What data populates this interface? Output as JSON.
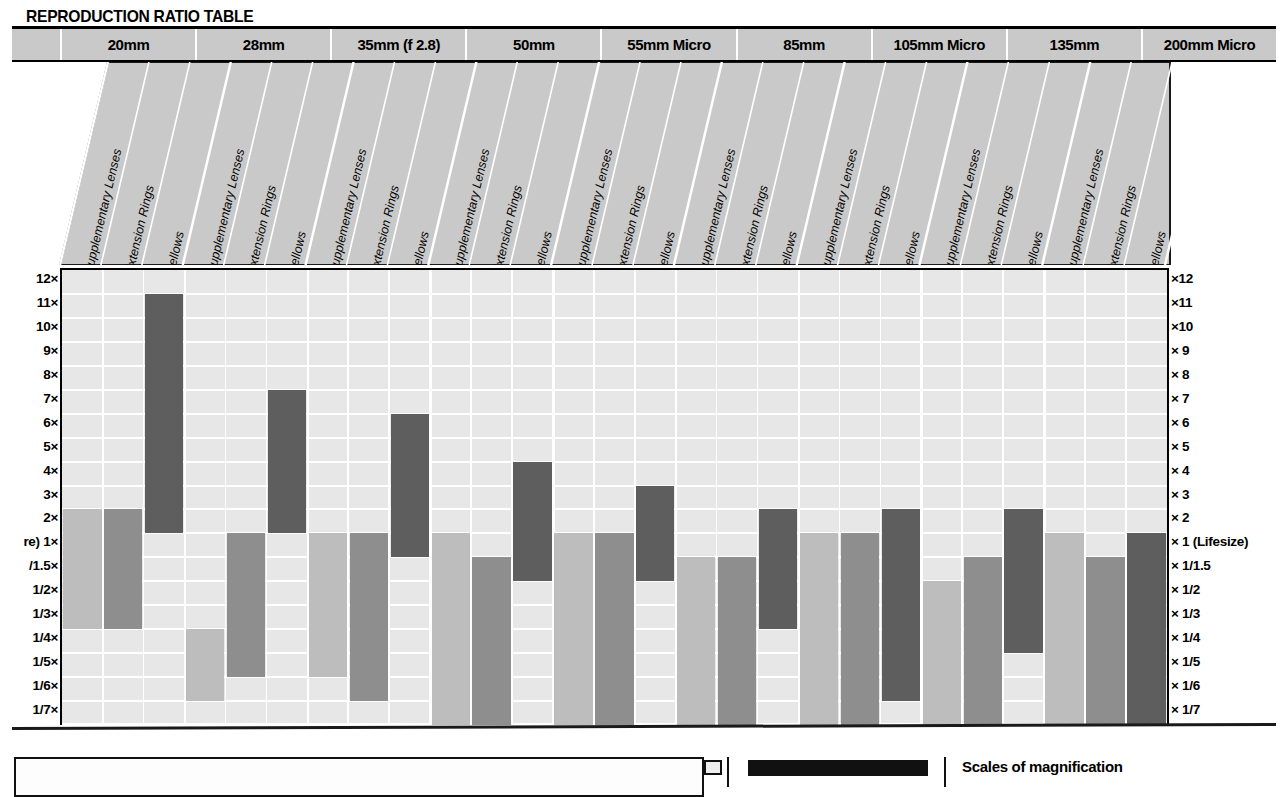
{
  "header": {
    "title": "REPRODUCTION RATIO TABLE"
  },
  "lens_groups": [
    {
      "label": "20mm"
    },
    {
      "label": "28mm"
    },
    {
      "label": "35mm (f 2.8)"
    },
    {
      "label": "50mm"
    },
    {
      "label": "55mm Micro"
    },
    {
      "label": "85mm"
    },
    {
      "label": "105mm Micro"
    },
    {
      "label": "135mm"
    },
    {
      "label": "200mm Micro"
    }
  ],
  "accessory_types": [
    "Supplementary Lenses",
    "Extension Rings",
    "Bellows"
  ],
  "axis_left_labels": [
    "12×",
    "11×",
    "10×",
    "9×",
    "8×",
    "7×",
    "6×",
    "5×",
    "4×",
    "3×",
    "2×",
    "re) 1×",
    "/1.5×",
    "1/2×",
    "1/3×",
    "1/4×",
    "1/5×",
    "1/6×",
    "1/7×"
  ],
  "axis_right_labels": [
    "×12",
    "×11",
    "×10",
    "× 9",
    "× 8",
    "× 7",
    "× 6",
    "× 5",
    "× 4",
    "× 3",
    "× 2",
    "× 1 (Lifesize)",
    "× 1/1.5",
    "× 1/2",
    "× 1/3",
    "× 1/4",
    "× 1/5",
    "× 1/6",
    "× 1/7"
  ],
  "colors": {
    "supplementary": "#bdbdbd",
    "extension": "#8e8e8e",
    "bellows": "#5e5e5e",
    "plot_bg": "#e7e7e7",
    "grid": "#ffffff",
    "header_cell": "#c9c9c9",
    "skew_band": "#c9c9c9",
    "ink": "#000000"
  },
  "legend": {
    "scales_label": "Scales of magnification"
  },
  "chart_data": {
    "type": "bar",
    "title": "REPRODUCTION RATIO TABLE",
    "xlabel": "",
    "ylabel": "Reproduction ratio (magnification)",
    "grid": true,
    "legend_position": "bottom",
    "y_scale_order_top_to_bottom": [
      "12x",
      "11x",
      "10x",
      "9x",
      "8x",
      "7x",
      "6x",
      "5x",
      "4x",
      "3x",
      "2x",
      "1x (Lifesize)",
      "1/1.5x",
      "1/2x",
      "1/3x",
      "1/4x",
      "1/5x",
      "1/6x",
      "1/7x"
    ],
    "note": "Each bar is a floating range bar spanning the min and max reproduction ratio attainable. Values given as row-index positions on the non-linear magnification scale where 0 = 12x row and 18 = 1/7x row.",
    "categories": [
      "20mm",
      "28mm",
      "35mm (f 2.8)",
      "50mm",
      "55mm Micro",
      "85mm",
      "105mm Micro",
      "135mm",
      "200mm Micro"
    ],
    "series": [
      {
        "name": "Supplementary Lenses",
        "color": "#bdbdbd",
        "ranges": [
          {
            "lens": "20mm",
            "top_row": 10,
            "bottom_row": 14,
            "top_label": "2x",
            "bottom_label": "1/3x"
          },
          {
            "lens": "28mm",
            "top_row": 15,
            "bottom_row": 17,
            "top_label": "1/4x",
            "bottom_label": "1/6x"
          },
          {
            "lens": "35mm (f 2.8)",
            "top_row": 11,
            "bottom_row": 16,
            "top_label": "1x",
            "bottom_label": "1/5x"
          },
          {
            "lens": "50mm",
            "top_row": 11,
            "bottom_row": 18,
            "top_label": "1x",
            "bottom_label": "1/7x"
          },
          {
            "lens": "55mm Micro",
            "top_row": 11,
            "bottom_row": 18,
            "top_label": "1x",
            "bottom_label": "1/7x"
          },
          {
            "lens": "85mm",
            "top_row": 12,
            "bottom_row": 18,
            "top_label": "1/1.5x",
            "bottom_label": "1/7x"
          },
          {
            "lens": "105mm Micro",
            "top_row": 11,
            "bottom_row": 18,
            "top_label": "1x",
            "bottom_label": "1/7x"
          },
          {
            "lens": "135mm",
            "top_row": 13,
            "bottom_row": 18,
            "top_label": "1/2x",
            "bottom_label": "1/7x"
          },
          {
            "lens": "200mm Micro",
            "top_row": 11,
            "bottom_row": 18,
            "top_label": "1x",
            "bottom_label": "1/7x"
          }
        ]
      },
      {
        "name": "Extension Rings",
        "color": "#8e8e8e",
        "ranges": [
          {
            "lens": "20mm",
            "top_row": 10,
            "bottom_row": 14,
            "top_label": "2x",
            "bottom_label": "1/3x"
          },
          {
            "lens": "28mm",
            "top_row": 11,
            "bottom_row": 16,
            "top_label": "1x",
            "bottom_label": "1/5x"
          },
          {
            "lens": "35mm (f 2.8)",
            "top_row": 11,
            "bottom_row": 17,
            "top_label": "1x",
            "bottom_label": "1/6x"
          },
          {
            "lens": "50mm",
            "top_row": 12,
            "bottom_row": 18,
            "top_label": "1/1.5x",
            "bottom_label": "1/7x"
          },
          {
            "lens": "55mm Micro",
            "top_row": 11,
            "bottom_row": 18,
            "top_label": "1x",
            "bottom_label": "1/7x"
          },
          {
            "lens": "85mm",
            "top_row": 12,
            "bottom_row": 18,
            "top_label": "1/1.5x",
            "bottom_label": "1/7x"
          },
          {
            "lens": "105mm Micro",
            "top_row": 11,
            "bottom_row": 18,
            "top_label": "1x",
            "bottom_label": "1/7x"
          },
          {
            "lens": "135mm",
            "top_row": 12,
            "bottom_row": 18,
            "top_label": "1/1.5x",
            "bottom_label": "1/7x"
          },
          {
            "lens": "200mm Micro",
            "top_row": 12,
            "bottom_row": 18,
            "top_label": "1/1.5x",
            "bottom_label": "1/7x"
          }
        ]
      },
      {
        "name": "Bellows",
        "color": "#5e5e5e",
        "ranges": [
          {
            "lens": "20mm",
            "top_row": 1,
            "bottom_row": 10,
            "top_label": "11x",
            "bottom_label": "2x"
          },
          {
            "lens": "28mm",
            "top_row": 5,
            "bottom_row": 10,
            "top_label": "7x",
            "bottom_label": "2x"
          },
          {
            "lens": "35mm (f 2.8)",
            "top_row": 6,
            "bottom_row": 11,
            "top_label": "6x",
            "bottom_label": "1x"
          },
          {
            "lens": "50mm",
            "top_row": 8,
            "bottom_row": 12,
            "top_label": "4x",
            "bottom_label": "1/1.5x"
          },
          {
            "lens": "55mm Micro",
            "top_row": 9,
            "bottom_row": 12,
            "top_label": "3x",
            "bottom_label": "1/1.5x"
          },
          {
            "lens": "85mm",
            "top_row": 10,
            "bottom_row": 14,
            "top_label": "2x",
            "bottom_label": "1/3x"
          },
          {
            "lens": "105mm Micro",
            "top_row": 10,
            "bottom_row": 17,
            "top_label": "2x",
            "bottom_label": "1/6x"
          },
          {
            "lens": "135mm",
            "top_row": 10,
            "bottom_row": 15,
            "top_label": "2x",
            "bottom_label": "1/4x"
          },
          {
            "lens": "200mm Micro",
            "top_row": 11,
            "bottom_row": 18,
            "top_label": "1x",
            "bottom_label": "1/7x"
          }
        ]
      }
    ]
  }
}
